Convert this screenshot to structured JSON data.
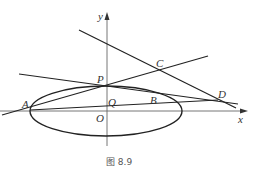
{
  "figure": {
    "caption": "图 8.9",
    "axes": {
      "x_label": "x",
      "y_label": "y",
      "origin_label": "O"
    },
    "points": {
      "A": "A",
      "B": "B",
      "C": "C",
      "D": "D",
      "P": "P",
      "Q": "Q"
    },
    "shapes": [
      "ellipse centered at O",
      "line through A and C",
      "line through P, B and D",
      "line through C and D",
      "line through A, Q and D"
    ],
    "colors": {
      "stroke": "#222222",
      "axis": "#555555",
      "text": "#333333"
    }
  }
}
